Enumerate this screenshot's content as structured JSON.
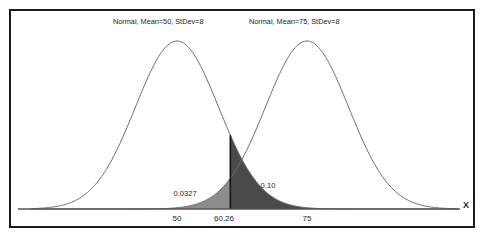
{
  "chart_data": {
    "type": "line",
    "title": "",
    "xlabel": "X",
    "ylabel": "",
    "grid": false,
    "legend_position": "inline-top",
    "axis": {
      "x_tick_labels": [
        "50",
        "60.26",
        "75"
      ],
      "x_tick_values": [
        50,
        60.26,
        75
      ],
      "x_axis_label": "X",
      "x_view_min": 22,
      "x_view_max": 104
    },
    "series": [
      {
        "name": "Normal, Mean=50, StDev=8",
        "distribution": "normal",
        "mean": 50,
        "stdev": 8,
        "label_text": "Normal, Mean=50, StDev=8"
      },
      {
        "name": "Normal, Mean=75, StDev=8",
        "distribution": "normal",
        "mean": 75,
        "stdev": 8,
        "label_text": "Normal, Mean=75, StDev=8"
      }
    ],
    "critical_value": 60.26,
    "shaded_regions": [
      {
        "name": "beta-region",
        "series": "Normal, Mean=75, StDev=8",
        "side": "left",
        "bound": 60.26,
        "value": 0.0327,
        "label": "0.0327",
        "color": "#8c8c8c"
      },
      {
        "name": "alpha-region",
        "series": "Normal, Mean=50, StDev=8",
        "side": "right",
        "bound": 60.26,
        "value": 0.1,
        "label": "0.10",
        "color": "#4a4a4a"
      }
    ],
    "annotations": [
      {
        "name": "left-probability",
        "text": "0.0327",
        "x": 55,
        "y_px": 194
      },
      {
        "name": "right-probability",
        "text": "0.10",
        "x": 68,
        "y_px": 187
      }
    ]
  },
  "labels": {
    "curve_one_title": "Normal, Mean=50, StDev=8",
    "curve_two_title": "Normal, Mean=75, StDev=8",
    "tick_50": "50",
    "tick_critical": "60.26",
    "tick_75": "75",
    "axis_x": "X",
    "prob_left": "0.0327",
    "prob_right": "0.10"
  },
  "colors": {
    "border": "#1a1a1a",
    "curve": "#6e6e6e",
    "axis": "#555555",
    "divider": "#141414",
    "shade_light": "#8c8c8c",
    "shade_dark": "#4a4a4a",
    "background": "#ffffff",
    "text": "#1c1c1c"
  }
}
